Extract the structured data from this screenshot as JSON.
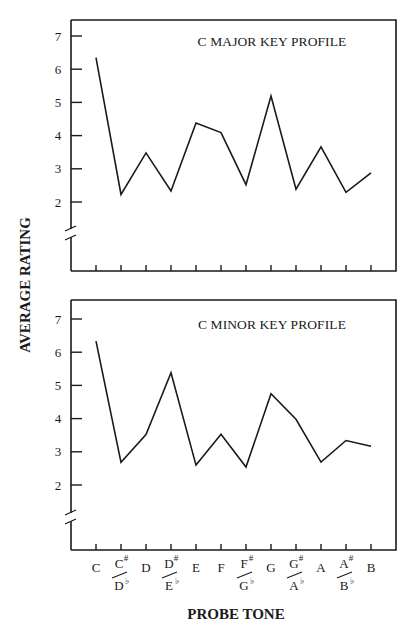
{
  "figure": {
    "ylabel": "AVERAGE RATING",
    "xlabel": "PROBE TONE",
    "yticks": [
      "7",
      "6",
      "5",
      "4",
      "3",
      "2"
    ],
    "xticks": [
      {
        "top": "C",
        "bottom": "",
        "top_acc": "",
        "bottom_acc": ""
      },
      {
        "top": "C",
        "top_acc": "#",
        "bottom": "D",
        "bottom_acc": "♭"
      },
      {
        "top": "D",
        "bottom": "",
        "top_acc": "",
        "bottom_acc": ""
      },
      {
        "top": "D",
        "top_acc": "#",
        "bottom": "E",
        "bottom_acc": "♭"
      },
      {
        "top": "E",
        "bottom": "",
        "top_acc": "",
        "bottom_acc": ""
      },
      {
        "top": "F",
        "bottom": "",
        "top_acc": "",
        "bottom_acc": ""
      },
      {
        "top": "F",
        "top_acc": "#",
        "bottom": "G",
        "bottom_acc": "♭"
      },
      {
        "top": "G",
        "bottom": "",
        "top_acc": "",
        "bottom_acc": ""
      },
      {
        "top": "G",
        "top_acc": "#",
        "bottom": "A",
        "bottom_acc": "♭"
      },
      {
        "top": "A",
        "bottom": "",
        "top_acc": "",
        "bottom_acc": ""
      },
      {
        "top": "A",
        "top_acc": "#",
        "bottom": "B",
        "bottom_acc": "♭"
      },
      {
        "top": "B",
        "bottom": "",
        "top_acc": "",
        "bottom_acc": ""
      }
    ],
    "line_color": "#1a1a1a"
  },
  "panels": [
    {
      "title": "C MAJOR KEY PROFILE"
    },
    {
      "title": "C MINOR KEY PROFILE"
    }
  ],
  "chart_data": [
    {
      "type": "line",
      "title": "C MAJOR KEY PROFILE",
      "xlabel": "PROBE TONE",
      "ylabel": "AVERAGE RATING",
      "categories": [
        "C",
        "C#/Db",
        "D",
        "D#/Eb",
        "E",
        "F",
        "F#/Gb",
        "G",
        "G#/Ab",
        "A",
        "A#/Bb",
        "B"
      ],
      "values": [
        6.35,
        2.23,
        3.48,
        2.33,
        4.38,
        4.09,
        2.52,
        5.19,
        2.39,
        3.66,
        2.29,
        2.88
      ],
      "yticks": [
        2,
        3,
        4,
        5,
        6,
        7
      ],
      "ylim": [
        0.8,
        7.5
      ],
      "axis_break": true,
      "grid": false,
      "legend": "none"
    },
    {
      "type": "line",
      "title": "C MINOR KEY PROFILE",
      "xlabel": "PROBE TONE",
      "ylabel": "AVERAGE RATING",
      "categories": [
        "C",
        "C#/Db",
        "D",
        "D#/Eb",
        "E",
        "F",
        "F#/Gb",
        "G",
        "G#/Ab",
        "A",
        "A#/Bb",
        "B"
      ],
      "values": [
        6.33,
        2.68,
        3.52,
        5.38,
        2.6,
        3.53,
        2.54,
        4.75,
        3.98,
        2.69,
        3.34,
        3.17
      ],
      "yticks": [
        2,
        3,
        4,
        5,
        6,
        7
      ],
      "ylim": [
        0.8,
        7.5
      ],
      "axis_break": true,
      "grid": false,
      "legend": "none"
    }
  ]
}
